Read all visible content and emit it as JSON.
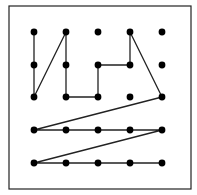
{
  "diagram": {
    "type": "dot-grid-path",
    "grid": {
      "cols": 5,
      "rows": 5
    },
    "colors": {
      "background": "#ffffff",
      "border": "#222222",
      "dot": "#000000",
      "line": "#222222"
    },
    "frame": {
      "x": 9,
      "y": 6,
      "width": 182,
      "height": 183
    },
    "col_x": [
      34,
      66,
      98,
      130,
      162
    ],
    "row_y": [
      32,
      65,
      97,
      130,
      163
    ],
    "dot_radius": 3.4,
    "path": [
      [
        0,
        0
      ],
      [
        0,
        1
      ],
      [
        0,
        2
      ],
      [
        1,
        0
      ],
      [
        1,
        1
      ],
      [
        1,
        2
      ],
      [
        2,
        2
      ],
      [
        2,
        1
      ],
      [
        3,
        1
      ],
      [
        3,
        0
      ],
      [
        4,
        2
      ],
      [
        0,
        3
      ],
      [
        1,
        3
      ],
      [
        2,
        3
      ],
      [
        3,
        3
      ],
      [
        4,
        3
      ],
      [
        0,
        4
      ],
      [
        1,
        4
      ],
      [
        2,
        4
      ],
      [
        3,
        4
      ],
      [
        4,
        4
      ]
    ],
    "unconnected_dots": [
      [
        2,
        0
      ],
      [
        4,
        0
      ],
      [
        4,
        1
      ],
      [
        3,
        2
      ]
    ]
  }
}
